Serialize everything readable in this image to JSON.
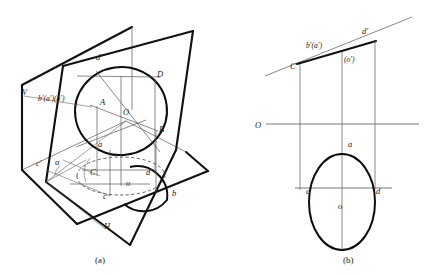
{
  "figure": {
    "background_color": "#ffffff",
    "ink_color": "#111111",
    "thin_line_color": "#555555",
    "panels": [
      {
        "id": "a",
        "caption": "(a)",
        "description": "Pictorial view: V frontal plane, H horizontal plane, inclined plane alpha carrying a circle whose horizontal projection is an ellipse",
        "labels": [
          {
            "key": "V",
            "text": "V",
            "x": 22,
            "y": 95,
            "style": "lbl"
          },
          {
            "key": "b_a_o_prime",
            "text": "b′(a′)(o′)",
            "x": 38,
            "y": 101,
            "style": "lbl-sm"
          },
          {
            "key": "d_prime_a",
            "text": "d′",
            "x": 96,
            "y": 60,
            "style": "lbl"
          },
          {
            "key": "D",
            "text": "D",
            "x": 157,
            "y": 77,
            "style": "lbl"
          },
          {
            "key": "A",
            "text": "A",
            "x": 100,
            "y": 105,
            "style": "lbl"
          },
          {
            "key": "O",
            "text": "O",
            "x": 123,
            "y": 115,
            "style": "lbl"
          },
          {
            "key": "B",
            "text": "B",
            "x": 159,
            "y": 132,
            "style": "lbl"
          },
          {
            "key": "a_lower",
            "text": "a",
            "x": 98,
            "y": 147,
            "style": "lbl"
          },
          {
            "key": "c_prime_a",
            "text": "c′",
            "x": 36,
            "y": 166,
            "style": "lbl"
          },
          {
            "key": "alpha",
            "text": "α",
            "x": 55,
            "y": 165,
            "style": "lbl"
          },
          {
            "key": "C",
            "text": "C",
            "x": 90,
            "y": 175,
            "style": "lbl"
          },
          {
            "key": "o_lower",
            "text": "o",
            "x": 126,
            "y": 186,
            "style": "lbl"
          },
          {
            "key": "d_lower",
            "text": "d",
            "x": 146,
            "y": 175,
            "style": "lbl"
          },
          {
            "key": "c_lower",
            "text": "c",
            "x": 103,
            "y": 199,
            "style": "lbl"
          },
          {
            "key": "b_lower",
            "text": "b",
            "x": 172,
            "y": 196,
            "style": "lbl"
          },
          {
            "key": "H",
            "text": "H",
            "x": 104,
            "y": 229,
            "style": "lbl"
          }
        ]
      },
      {
        "id": "b",
        "caption": "(b)",
        "description": "Orthographic two-view projection: frontal view is the inclined line C'-d', horizontal view is an ellipse",
        "labels": [
          {
            "key": "d_prime_b",
            "text": "d′",
            "x": 362,
            "y": 34,
            "style": "lbl"
          },
          {
            "key": "b_a_prime",
            "text": "b′(a′)",
            "x": 306,
            "y": 48,
            "style": "lbl-sm"
          },
          {
            "key": "o_prime",
            "text": "(o′)",
            "x": 344,
            "y": 62,
            "style": "lbl-sm"
          },
          {
            "key": "C_prime",
            "text": "C′",
            "x": 290,
            "y": 69,
            "style": "lbl"
          },
          {
            "key": "O_axis",
            "text": "O",
            "x": 255,
            "y": 128,
            "style": "lbl"
          },
          {
            "key": "a_b",
            "text": "a",
            "x": 348,
            "y": 147,
            "style": "lbl"
          },
          {
            "key": "c_b",
            "text": "c",
            "x": 306,
            "y": 194,
            "style": "lbl"
          },
          {
            "key": "d_b",
            "text": "d",
            "x": 376,
            "y": 194,
            "style": "lbl"
          },
          {
            "key": "o_b",
            "text": "o",
            "x": 338,
            "y": 209,
            "style": "lbl"
          }
        ]
      }
    ],
    "geometry": {
      "panel_a": {
        "v_plane_outline": "22,85 132,27 132,110 52,157 22,168",
        "v_plane_quad": "22,85 132,27 132,112 22,170",
        "h_plane_quad": "22,170 126,121 208,171 104,228",
        "inclined_plane_quad": "63,66 193,31 174,148 46,181",
        "circle_center_x": 121,
        "circle_center_y": 111,
        "circle_rx": 46,
        "circle_ry": 44,
        "ellipse_dashed_center_x": 121,
        "ellipse_dashed_center_y": 176,
        "ellipse_dashed_rx": 44,
        "ellipse_dashed_ry": 19
      },
      "panel_b": {
        "oblique_line": "265,76 412,17",
        "oblique_thick": "296,64 376,41",
        "axis_y": 124,
        "axis_x1": 265,
        "axis_x2": 419,
        "ellipse_center_x": 342,
        "ellipse_center_y": 202,
        "ellipse_rx": 33,
        "ellipse_ry": 48,
        "vertical_c": 300,
        "vertical_o": 342,
        "vertical_d": 375,
        "horizontal_cd_y": 188
      }
    }
  }
}
